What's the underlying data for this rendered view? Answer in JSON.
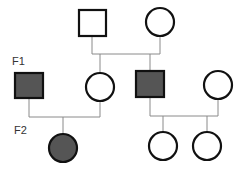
{
  "diagram": {
    "type": "pedigree",
    "generation_labels": {
      "f1": "F1",
      "f2": "F2"
    },
    "colors": {
      "affected_fill": "#555555",
      "stroke": "#111111",
      "line": "#888888",
      "unaffected_fill": "#ffffff"
    },
    "individuals": [
      {
        "id": "p0-father",
        "generation": "P",
        "sex": "male",
        "affected": false
      },
      {
        "id": "p0-mother",
        "generation": "P",
        "sex": "female",
        "affected": false
      },
      {
        "id": "f1-male-left",
        "generation": "F1",
        "sex": "male",
        "affected": true
      },
      {
        "id": "f1-female-left",
        "generation": "F1",
        "sex": "female",
        "affected": false
      },
      {
        "id": "f1-male-right",
        "generation": "F1",
        "sex": "male",
        "affected": true
      },
      {
        "id": "f1-female-right",
        "generation": "F1",
        "sex": "female",
        "affected": false
      },
      {
        "id": "f2-female-left",
        "generation": "F2",
        "sex": "female",
        "affected": true
      },
      {
        "id": "f2-female-mid",
        "generation": "F2",
        "sex": "female",
        "affected": false
      },
      {
        "id": "f2-female-right",
        "generation": "F2",
        "sex": "female",
        "affected": false
      }
    ]
  }
}
